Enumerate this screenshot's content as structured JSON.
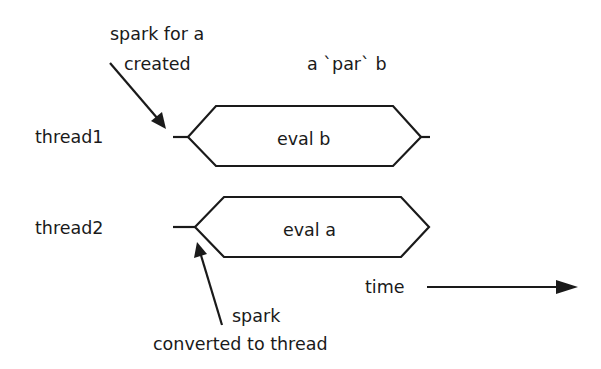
{
  "diagram": {
    "title": "a `par` b",
    "threads": [
      {
        "label": "thread1",
        "box_label": "eval b"
      },
      {
        "label": "thread2",
        "box_label": "eval a"
      }
    ],
    "annotations": {
      "spark_created_line1": "spark for a",
      "spark_created_line2": "created",
      "spark_converted_line1": "spark",
      "spark_converted_line2": "converted to thread"
    },
    "time_axis_label": "time",
    "colors": {
      "ink": "#1a1a1a",
      "background": "#ffffff"
    }
  }
}
